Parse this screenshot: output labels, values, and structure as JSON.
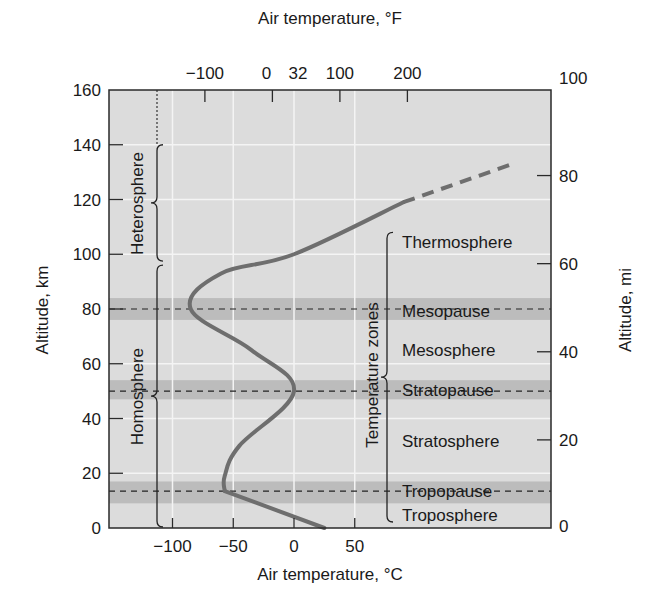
{
  "chart_data": {
    "type": "line",
    "title": "",
    "xlabel": "Air temperature, °C",
    "x2label": "Air temperature, °F",
    "ylabel": "Altitude, km",
    "y2label": "Altitude, mi",
    "xlim": [
      -150,
      215
    ],
    "ylim": [
      0,
      160
    ],
    "grid": true,
    "x_ticks": [
      -100,
      -50,
      0,
      50
    ],
    "x_tick_labels": [
      "−100",
      "−50",
      "0",
      "50"
    ],
    "x2_ticks_F": [
      -100,
      0,
      100,
      200
    ],
    "x2_tick_labels": [
      "−100",
      "0",
      "32",
      "100",
      "200"
    ],
    "x2_label_positions_F": [
      -100,
      0,
      32,
      100,
      200
    ],
    "y_ticks": [
      0,
      20,
      40,
      60,
      80,
      100,
      120,
      140,
      160
    ],
    "y2_ticks_mi": [
      0,
      20,
      40,
      60,
      80,
      100
    ],
    "series": [
      {
        "name": "Temperature profile (solid)",
        "style": "solid",
        "points": [
          [
            25,
            0
          ],
          [
            -57,
            13.5
          ],
          [
            -57,
            19
          ],
          [
            -45,
            30
          ],
          [
            0,
            50
          ],
          [
            -35,
            65
          ],
          [
            -85,
            80
          ],
          [
            -60,
            93
          ],
          [
            0,
            100
          ],
          [
            90,
            119
          ]
        ]
      },
      {
        "name": "Temperature profile (extrapolated)",
        "style": "dashed",
        "points": [
          [
            90,
            119
          ],
          [
            180,
            133
          ]
        ]
      }
    ],
    "bands": [
      {
        "name": "Mesopause",
        "y_from": 76,
        "y_to": 84,
        "line_y": 80
      },
      {
        "name": "Stratopause",
        "y_from": 47,
        "y_to": 54,
        "line_y": 50
      },
      {
        "name": "Tropopause",
        "y_from": 9,
        "y_to": 17,
        "line_y": 13.5
      }
    ],
    "temperature_zones": [
      {
        "label": "Thermosphere",
        "y": 103
      },
      {
        "label": "Mesopause",
        "y": 80
      },
      {
        "label": "Mesosphere",
        "y": 64
      },
      {
        "label": "Stratopause",
        "y": 50
      },
      {
        "label": "Stratosphere",
        "y": 33
      },
      {
        "label": "Tropopause",
        "y": 13.5
      },
      {
        "label": "Troposphere",
        "y": 5
      }
    ],
    "left_regions": [
      {
        "label": "Heterosphere",
        "y_from": 97,
        "y_to": 140
      },
      {
        "label": "Homosphere",
        "y_from": 0,
        "y_to": 96
      }
    ],
    "bracket_label": "Temperature zones"
  },
  "colors": {
    "plot_bg": "#dcdcdc",
    "band": "#bcbcbc",
    "grid": "#f4f4f4",
    "curve": "#6e6e6e",
    "axis": "#2a2a2a",
    "text": "#1a1a1a"
  }
}
